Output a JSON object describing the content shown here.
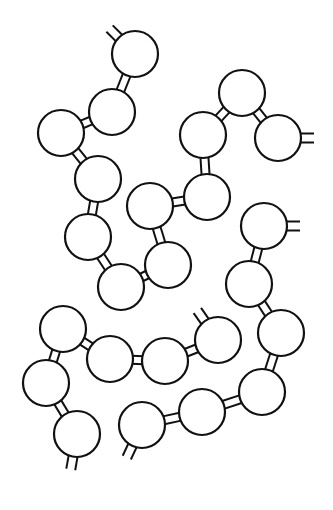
{
  "diagram": {
    "type": "polymer-chains",
    "stroke_color": "#111111",
    "background": "#ffffff",
    "bead_radius": 23,
    "beads": [
      {
        "id": "b1",
        "x": 135,
        "y": 54
      },
      {
        "id": "b2",
        "x": 112,
        "y": 112
      },
      {
        "id": "b3",
        "x": 61,
        "y": 133
      },
      {
        "id": "b4",
        "x": 98,
        "y": 179
      },
      {
        "id": "b5",
        "x": 88,
        "y": 237
      },
      {
        "id": "b6",
        "x": 242,
        "y": 93
      },
      {
        "id": "b7",
        "x": 203,
        "y": 135
      },
      {
        "id": "b8",
        "x": 278,
        "y": 138
      },
      {
        "id": "b9",
        "x": 207,
        "y": 197
      },
      {
        "id": "b10",
        "x": 150,
        "y": 206
      },
      {
        "id": "b11",
        "x": 264,
        "y": 226
      },
      {
        "id": "b12",
        "x": 168,
        "y": 265
      },
      {
        "id": "b13",
        "x": 121,
        "y": 287
      },
      {
        "id": "b14",
        "x": 249,
        "y": 284
      },
      {
        "id": "b15",
        "x": 281,
        "y": 333
      },
      {
        "id": "b16",
        "x": 262,
        "y": 392
      },
      {
        "id": "b17",
        "x": 202,
        "y": 412
      },
      {
        "id": "b18",
        "x": 142,
        "y": 425
      },
      {
        "id": "b19",
        "x": 63,
        "y": 329
      },
      {
        "id": "b20",
        "x": 110,
        "y": 359
      },
      {
        "id": "b21",
        "x": 165,
        "y": 361
      },
      {
        "id": "b22",
        "x": 218,
        "y": 340
      },
      {
        "id": "b23",
        "x": 46,
        "y": 383
      },
      {
        "id": "b24",
        "x": 77,
        "y": 434
      }
    ],
    "links": [
      [
        "b1",
        "b2"
      ],
      [
        "b2",
        "b3"
      ],
      [
        "b3",
        "b4"
      ],
      [
        "b4",
        "b5"
      ],
      [
        "b5",
        "b13"
      ],
      [
        "b6",
        "b7"
      ],
      [
        "b6",
        "b8"
      ],
      [
        "b7",
        "b9"
      ],
      [
        "b9",
        "b10"
      ],
      [
        "b10",
        "b12"
      ],
      [
        "b12",
        "b13"
      ],
      [
        "b11",
        "b14"
      ],
      [
        "b14",
        "b15"
      ],
      [
        "b15",
        "b16"
      ],
      [
        "b16",
        "b17"
      ],
      [
        "b17",
        "b18"
      ],
      [
        "b19",
        "b20"
      ],
      [
        "b20",
        "b21"
      ],
      [
        "b21",
        "b22"
      ],
      [
        "b19",
        "b23"
      ],
      [
        "b23",
        "b24"
      ]
    ],
    "chain_ends": [
      {
        "bead": "b1",
        "angle_deg": 225
      },
      {
        "bead": "b8",
        "angle_deg": 0
      },
      {
        "bead": "b11",
        "angle_deg": 0
      },
      {
        "bead": "b22",
        "angle_deg": 235
      },
      {
        "bead": "b24",
        "angle_deg": 100
      },
      {
        "bead": "b18",
        "angle_deg": 115
      }
    ]
  }
}
